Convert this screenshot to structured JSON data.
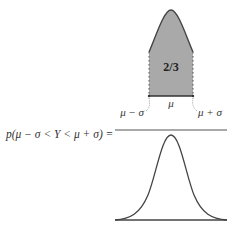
{
  "diagram": {
    "equation_lhs": "p(μ − σ < Y < μ + σ) =",
    "numerator_shaded_area_label": "2/3",
    "mu_label": "μ",
    "left_bound_label": "μ − σ",
    "right_bound_label": "μ + σ",
    "denominator": "full normal curve",
    "colors": {
      "shade": "#a9a9a9",
      "stroke": "#444444",
      "fraction_bar": "#555555"
    }
  }
}
